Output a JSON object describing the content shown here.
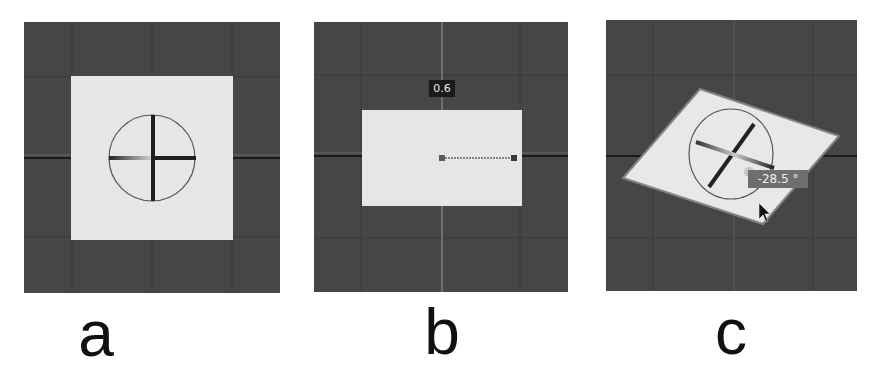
{
  "figure": {
    "panels": [
      {
        "id": "a",
        "label": "a",
        "description": "Square plane with circular rotation gizmo and cross handles, viewed top-down"
      },
      {
        "id": "b",
        "label": "b",
        "description": "Plane scaled to a rectangle with scale handle line and value tooltip",
        "tooltip_value": "0.6"
      },
      {
        "id": "c",
        "label": "c",
        "description": "Plane rotated with rotation gizmo, angle tooltip and mouse cursor",
        "tooltip_value": "-28.5 °"
      }
    ],
    "colors": {
      "viewport_bg": "#464646",
      "grid_line": "#3a3a3a",
      "plane_fill": "#e6e6e6",
      "handle_dark": "#1e1e1e",
      "tooltip_dark_bg": "#1a1a1a",
      "tooltip_gray_bg": "#6e6e6e"
    },
    "caption_cutoff": ""
  }
}
